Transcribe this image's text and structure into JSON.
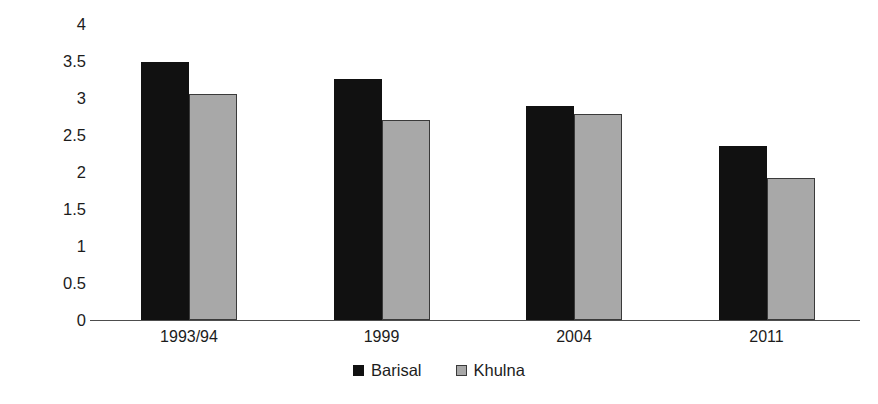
{
  "chart_data": {
    "type": "bar",
    "title": "",
    "xlabel": "",
    "ylabel": "Total fertility rate",
    "categories": [
      "1993/94",
      "1999",
      "2004",
      "2011"
    ],
    "series": [
      {
        "name": "Barisal",
        "color": "#111111",
        "values": [
          3.48,
          3.26,
          2.89,
          2.35
        ]
      },
      {
        "name": "Khulna",
        "color": "#a8a8a8",
        "values": [
          3.05,
          2.7,
          2.78,
          1.92
        ]
      }
    ],
    "ylim": [
      0,
      4
    ],
    "ytick_step": 0.5,
    "ytick_labels": [
      "4",
      "3.5",
      "3",
      "2.5",
      "2",
      "1.5",
      "1",
      "0.5",
      "0"
    ],
    "ytick_values": [
      4,
      3.5,
      3,
      2.5,
      2,
      1.5,
      1,
      0.5,
      0
    ],
    "grid": false,
    "legend_position": "bottom"
  }
}
